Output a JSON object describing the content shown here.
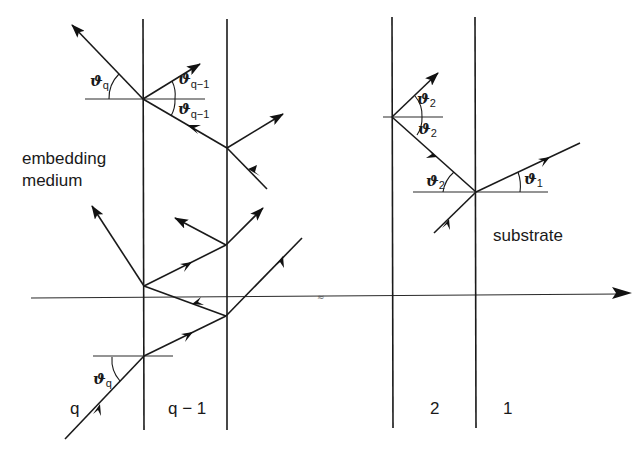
{
  "labels": {
    "embedding_medium_line1": "embedding",
    "embedding_medium_line2": "medium",
    "substrate": "substrate",
    "layer_q": "q",
    "layer_q_minus_1": "q − 1",
    "layer_2": "2",
    "layer_1": "1",
    "axis_break": "≈"
  },
  "angles": {
    "theta_symbol": "ϑ",
    "theta_q_sub": "q",
    "theta_q_minus_1_sub": "q−1",
    "theta_2_sub": "2",
    "theta_1_sub": "1"
  },
  "colors": {
    "ink": "#1a1a1a",
    "background": "#ffffff"
  }
}
